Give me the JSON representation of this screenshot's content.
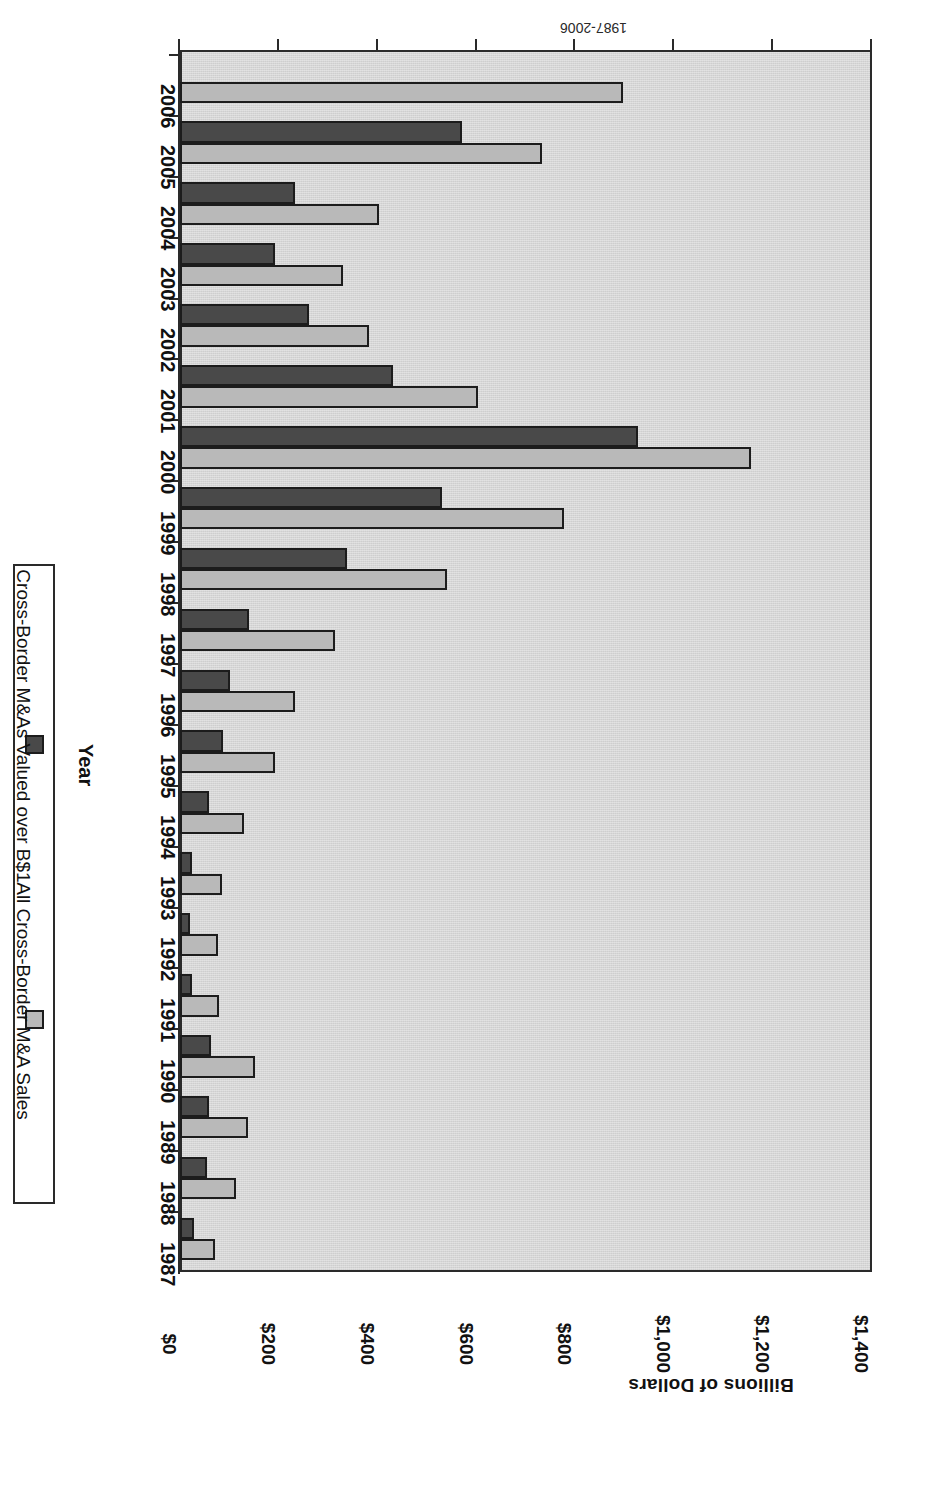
{
  "chart_data": {
    "type": "bar",
    "orientation": "horizontal-rotated-180",
    "title": "",
    "xlabel": "Year",
    "ylabel": "Billions of Dollars",
    "ylim": [
      0,
      1400
    ],
    "ytick_labels": [
      "$0",
      "$200",
      "$400",
      "$600",
      "$800",
      "$1,000",
      "$1,200",
      "$1,400"
    ],
    "ytick_values": [
      0,
      200,
      400,
      600,
      800,
      1000,
      1200,
      1400
    ],
    "grid": false,
    "legend_position": "right",
    "categories": [
      "1987",
      "1988",
      "1989",
      "1990",
      "1991",
      "1992",
      "1993",
      "1994",
      "1995",
      "1996",
      "1997",
      "1998",
      "1999",
      "2000",
      "2001",
      "2002",
      "2003",
      "2004",
      "2005",
      "2006"
    ],
    "series": [
      {
        "name": "Cross-Border M&As Valued over B$1",
        "color": "#494949",
        "values": [
          28,
          55,
          59,
          63,
          24,
          21,
          24,
          59,
          87,
          101,
          140,
          338,
          530,
          927,
          430,
          261,
          193,
          233,
          570,
          0
        ]
      },
      {
        "name": "All Cross-Border M&A Sales",
        "color": "#b9b9b9",
        "values": [
          71,
          113,
          138,
          152,
          79,
          77,
          84,
          130,
          192,
          233,
          314,
          540,
          777,
          1155,
          603,
          382,
          330,
          403,
          732,
          896
        ]
      }
    ]
  },
  "axes": {
    "value_axis_title": "Billions of Dollars",
    "category_axis_title": "Year"
  },
  "legend": {
    "items": [
      {
        "label": "Cross-Border M&As Valued over B$1",
        "swatch": "dark-swatch-icon"
      },
      {
        "label": "All Cross-Border M&A Sales",
        "swatch": "light-swatch-icon"
      }
    ]
  },
  "caption": {
    "text": "1987-2006"
  },
  "colors": {
    "plot_background": "#d6d6d6",
    "axis": "#2a2a2a",
    "series_dark": "#494949",
    "series_light": "#b9b9b9",
    "page_background": "#ffffff"
  }
}
